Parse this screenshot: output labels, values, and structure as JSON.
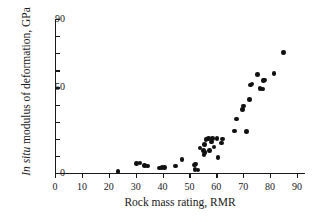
{
  "chart_data": {
    "type": "scatter",
    "title": "",
    "xlabel": "Rock mass rating, RMR",
    "ylabel_italic": "In situ",
    "ylabel_rest": " modulus of deformation, GPa",
    "ylabel": "In situ modulus of deformation, GPa",
    "xlim": [
      0,
      95
    ],
    "ylim": [
      0,
      90
    ],
    "x_tick_step": 10,
    "y_tick_step": 10,
    "x_ticks": [
      0,
      10,
      20,
      30,
      40,
      50,
      60,
      70,
      80,
      90
    ],
    "y_ticks": [
      0,
      10,
      20,
      30,
      40,
      50,
      60,
      70,
      80,
      90
    ],
    "x_tick_labels": [
      "0",
      "10",
      "20",
      "30",
      "40",
      "50",
      "60",
      "70",
      "80",
      "90"
    ],
    "y_tick_labels_shown": [
      "0",
      "50",
      "90"
    ],
    "y_labeled_values": [
      0,
      50,
      90
    ],
    "grid": false,
    "legend": false,
    "marker": "filled-circle",
    "marker_color": "#111111",
    "axis_color": "#1a1a1a",
    "background": "#ffffff",
    "series": [
      {
        "name": "In situ modulus vs RMR",
        "points": [
          [
            23.5,
            1.0
          ],
          [
            30.3,
            5.5
          ],
          [
            31.6,
            5.8
          ],
          [
            33.2,
            4.3
          ],
          [
            34.3,
            4.2
          ],
          [
            38.8,
            3.0
          ],
          [
            39.8,
            3.2
          ],
          [
            40.8,
            3.3
          ],
          [
            44.9,
            4.2
          ],
          [
            47.2,
            8.0
          ],
          [
            51.8,
            4.6
          ],
          [
            52.0,
            2.0
          ],
          [
            52.3,
            5.2
          ],
          [
            53.2,
            1.7
          ],
          [
            53.9,
            14.5
          ],
          [
            55.2,
            13.0
          ],
          [
            55.4,
            10.8
          ],
          [
            55.6,
            16.6
          ],
          [
            55.8,
            12.0
          ],
          [
            56.2,
            19.5
          ],
          [
            57.1,
            20.0
          ],
          [
            57.4,
            13.3
          ],
          [
            58.3,
            18.2
          ],
          [
            58.6,
            20.3
          ],
          [
            59.2,
            15.3
          ],
          [
            60.3,
            20.2
          ],
          [
            60.6,
            9.0
          ],
          [
            62.0,
            17.5
          ],
          [
            62.3,
            19.8
          ],
          [
            66.8,
            24.6
          ],
          [
            67.4,
            31.5
          ],
          [
            69.8,
            37.0
          ],
          [
            70.2,
            39.2
          ],
          [
            71.3,
            24.4
          ],
          [
            72.4,
            43.0
          ],
          [
            72.7,
            51.5
          ],
          [
            73.3,
            52.0
          ],
          [
            75.4,
            57.5
          ],
          [
            76.2,
            49.5
          ],
          [
            77.2,
            49.0
          ],
          [
            77.6,
            54.2
          ],
          [
            78.0,
            54.3
          ],
          [
            81.5,
            58.0
          ],
          [
            85.0,
            70.5
          ]
        ]
      }
    ]
  }
}
